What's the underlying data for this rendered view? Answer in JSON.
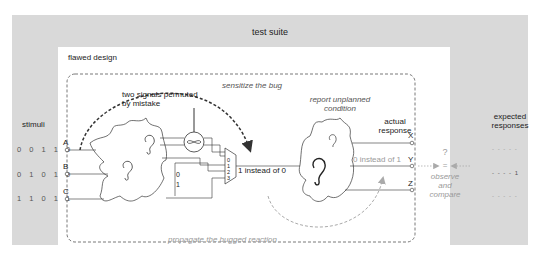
{
  "test_suite": {
    "title": "test suite",
    "stimuli_label": "stimuli",
    "expected_label": "expected\nresponses",
    "stimuli_rows": [
      "0 0 1 1 0",
      "0 1 0 1 0",
      "1 1 0 1 1"
    ],
    "expected_rows": [
      "- - - - -",
      "- - - - 1",
      "- - - - -"
    ]
  },
  "flawed_design": {
    "title": "flawed design",
    "inputs": [
      "A",
      "B",
      "C"
    ],
    "outputs": [
      "X",
      "Y",
      "Z"
    ],
    "permute_note": "two signals permuted\nby mistake",
    "mux_inputs": [
      "0",
      "1",
      "2",
      "3"
    ],
    "constants": [
      "0",
      "1"
    ],
    "bug_value": "1 instead of 0",
    "sensitize_label": "sensitize the bug",
    "report_label": "report unplanned\ncondition",
    "actual_label": "actual\nresponse",
    "response_value": "0 instead of 1",
    "propagate_label": "propagate the bugged reaction"
  },
  "compare": {
    "question": "?",
    "equals": "=",
    "label": "observe\nand\ncompare"
  },
  "colors": {
    "gray_band": "#d9d9d9",
    "line": "#333333",
    "light": "#9a9a9a"
  }
}
